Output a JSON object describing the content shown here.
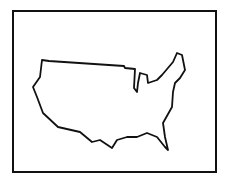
{
  "figure": {
    "stroke_color": "#111111",
    "background": "#ffffff"
  }
}
